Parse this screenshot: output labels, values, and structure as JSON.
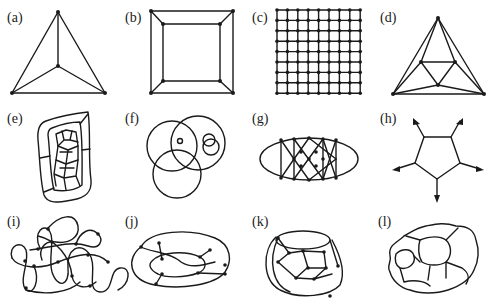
{
  "figure": {
    "panels": [
      {
        "id": "a",
        "label": "(a)",
        "description": "tetrahedron graph K4: outer triangle with central vertex"
      },
      {
        "id": "b",
        "label": "(b)",
        "description": "cube graph: two nested squares joined at corners"
      },
      {
        "id": "c",
        "label": "(c)",
        "description": "9x9 square lattice grid graph"
      },
      {
        "id": "d",
        "label": "(d)",
        "description": "octahedron-like planar graph: outer triangle, inner triangle, apex"
      },
      {
        "id": "e",
        "label": "(e)",
        "description": "irregular planar map with many cells inside nested boundary"
      },
      {
        "id": "f",
        "label": "(f)",
        "description": "arrangement of overlapping circles"
      },
      {
        "id": "g",
        "label": "(g)",
        "description": "ellipse with crossing lattice of vertices"
      },
      {
        "id": "h",
        "label": "(h)",
        "description": "pentagon with outward arrows at each vertex"
      },
      {
        "id": "i",
        "label": "(i)",
        "description": "knotted closed curve with crossing vertices"
      },
      {
        "id": "j",
        "label": "(j)",
        "description": "graph drawn on a torus"
      },
      {
        "id": "k",
        "label": "(k)",
        "description": "graph drawn on a handle / cylinder surface"
      },
      {
        "id": "l",
        "label": "(l)",
        "description": "irregular wavy planar regions map"
      }
    ]
  }
}
